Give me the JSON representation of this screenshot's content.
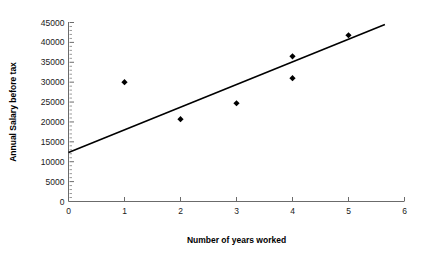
{
  "chart_data": {
    "type": "scatter",
    "title": "",
    "xlabel": "Number of years worked",
    "ylabel": "Annual Salary before tax",
    "xlim": [
      0,
      6
    ],
    "ylim": [
      0,
      45000
    ],
    "grid": false,
    "legend": false,
    "x_ticks": [
      "0",
      "1",
      "2",
      "3",
      "4",
      "5",
      "6"
    ],
    "x_tick_values": [
      0,
      1,
      2,
      3,
      4,
      5,
      6
    ],
    "y_ticks": [
      "0",
      "5000",
      "10000",
      "15000",
      "20000",
      "25000",
      "30000",
      "35000",
      "40000",
      "45000"
    ],
    "y_tick_values": [
      0,
      5000,
      10000,
      15000,
      20000,
      25000,
      30000,
      35000,
      40000,
      45000
    ],
    "y_minor_tick_step": 1000,
    "point_marker": "diamond",
    "point_color": "#000000",
    "line_color": "#000000",
    "series": [
      {
        "name": "Salary observations",
        "points": [
          {
            "x": 1,
            "y": 30000
          },
          {
            "x": 2,
            "y": 20700
          },
          {
            "x": 3,
            "y": 24700
          },
          {
            "x": 4,
            "y": 31000
          },
          {
            "x": 4,
            "y": 36500
          },
          {
            "x": 5,
            "y": 41800
          }
        ]
      }
    ],
    "trendline": {
      "name": "Line of best fit",
      "x_start": 0,
      "y_start": 12300,
      "x_end": 5.65,
      "y_end": 44500
    }
  }
}
